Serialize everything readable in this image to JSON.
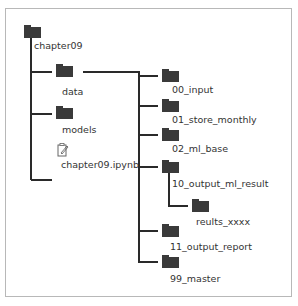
{
  "tree": {
    "root": {
      "label": "chapter09",
      "icon": "folder-icon"
    },
    "level1": [
      {
        "label": "data",
        "icon": "folder-icon"
      },
      {
        "label": "models",
        "icon": "folder-icon"
      },
      {
        "label": "chapter09.ipynb",
        "icon": "notebook-edit-icon"
      }
    ],
    "data_children": [
      {
        "label": "00_input",
        "icon": "folder-icon"
      },
      {
        "label": "01_store_monthly",
        "icon": "folder-icon"
      },
      {
        "label": "02_ml_base",
        "icon": "folder-icon"
      },
      {
        "label": "10_output_ml_result",
        "icon": "folder-icon"
      },
      {
        "label": "11_output_report",
        "icon": "folder-icon"
      },
      {
        "label": "99_master",
        "icon": "folder-icon"
      }
    ],
    "result_children": [
      {
        "label": "reults_xxxx",
        "icon": "folder-icon"
      }
    ]
  },
  "colors": {
    "line": "#2a2a2a",
    "folder": "#3a3a3a",
    "frame": "#b8b8b8",
    "text": "#333333"
  }
}
